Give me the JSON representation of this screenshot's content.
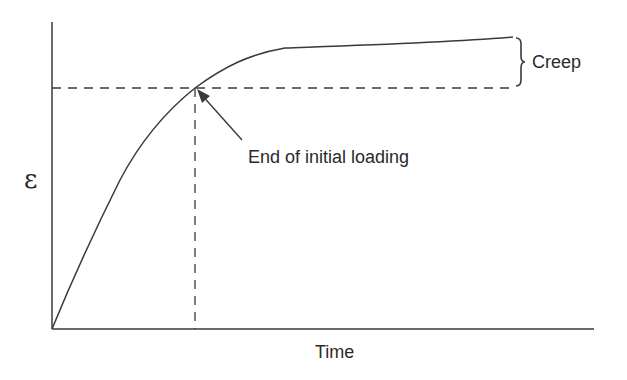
{
  "diagram": {
    "type": "strain-time creep curve",
    "y_axis_label": "ε",
    "x_axis_label": "Time",
    "annotations": {
      "loading_end": "End of initial loading",
      "creep": "Creep"
    },
    "colors": {
      "line": "#3a3a3a",
      "text": "#2a2a2a",
      "background": "#ffffff"
    }
  }
}
